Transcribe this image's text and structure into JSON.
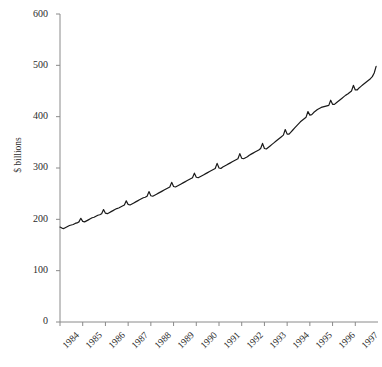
{
  "chart_data": {
    "type": "line",
    "title": "",
    "subtitle": "",
    "xlabel": "",
    "ylabel": "$ billions",
    "ylim": [
      0,
      600
    ],
    "yticks": [
      0,
      100,
      200,
      300,
      400,
      500,
      600
    ],
    "xlim": [
      1984,
      1998
    ],
    "xticks": [
      1984,
      1985,
      1986,
      1987,
      1988,
      1989,
      1990,
      1991,
      1992,
      1993,
      1994,
      1995,
      1996,
      1997
    ],
    "xtick_labels": [
      "1984",
      "1985",
      "1986",
      "1987",
      "1988",
      "1989",
      "1990",
      "1991",
      "1992",
      "1993",
      "1994",
      "1995",
      "1996",
      "1997"
    ],
    "grid": false,
    "legend": null,
    "legend_position": "none",
    "series": [
      {
        "name": "series-1",
        "color": "#1a1a1a",
        "x_start": 1984.0,
        "x_step": 0.0833333,
        "values": [
          185,
          183,
          182,
          184,
          186,
          188,
          189,
          190,
          192,
          193,
          195,
          202,
          196,
          195,
          197,
          199,
          201,
          203,
          204,
          206,
          208,
          209,
          211,
          219,
          212,
          211,
          213,
          215,
          217,
          219,
          221,
          222,
          224,
          226,
          228,
          236,
          229,
          228,
          230,
          232,
          234,
          236,
          238,
          240,
          242,
          243,
          245,
          254,
          246,
          245,
          247,
          249,
          251,
          253,
          255,
          257,
          259,
          261,
          263,
          272,
          264,
          263,
          265,
          267,
          269,
          271,
          273,
          275,
          277,
          279,
          281,
          290,
          282,
          281,
          283,
          285,
          287,
          289,
          291,
          293,
          295,
          297,
          299,
          309,
          300,
          299,
          302,
          304,
          306,
          308,
          310,
          312,
          314,
          316,
          318,
          328,
          319,
          318,
          320,
          322,
          325,
          327,
          329,
          331,
          333,
          335,
          338,
          348,
          338,
          337,
          340,
          343,
          346,
          349,
          352,
          355,
          358,
          361,
          364,
          375,
          366,
          366,
          370,
          374,
          378,
          382,
          386,
          390,
          393,
          396,
          399,
          410,
          403,
          404,
          408,
          411,
          414,
          416,
          418,
          419,
          420,
          421,
          422,
          432,
          424,
          424,
          427,
          430,
          433,
          436,
          439,
          442,
          444,
          447,
          450,
          461,
          452,
          452,
          456,
          459,
          462,
          465,
          468,
          471,
          474,
          478,
          485,
          498
        ]
      }
    ]
  },
  "axes": {
    "y_axis_name": "y-axis",
    "x_axis_name": "x-axis"
  }
}
